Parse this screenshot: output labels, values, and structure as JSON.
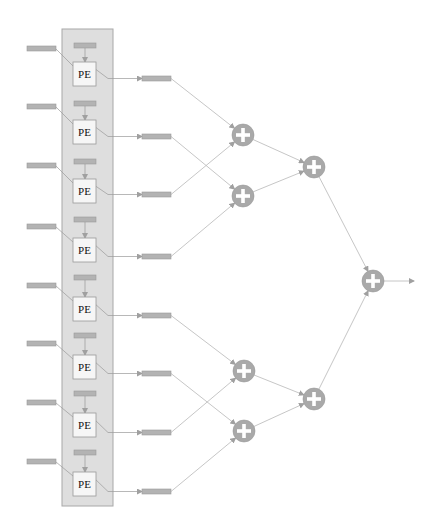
{
  "diagram": {
    "title": "",
    "pe_label": "PE",
    "colors": {
      "background": "#ffffff",
      "column_fill": "#dedede",
      "column_stroke": "#a8a8a8",
      "bar_fill": "#b3b3b3",
      "bar_stroke": "#9a9a9a",
      "pe_fill": "#f6f6f6",
      "pe_stroke": "#9a9a9a",
      "adder_fill": "#a9a9a9",
      "adder_plus": "#ffffff",
      "line": "#b8b8b8"
    },
    "column": {
      "x": 62,
      "y": 29,
      "width": 51,
      "height": 477
    },
    "rows": [
      {
        "index": 1,
        "pe_label": "PE",
        "top_bar_y": 43,
        "left_bar_y": 46,
        "pe_y": 62,
        "out_bar_y": 76
      },
      {
        "index": 2,
        "pe_label": "PE",
        "top_bar_y": 101,
        "left_bar_y": 104,
        "pe_y": 120,
        "out_bar_y": 134
      },
      {
        "index": 3,
        "pe_label": "PE",
        "top_bar_y": 159,
        "left_bar_y": 163,
        "pe_y": 179,
        "out_bar_y": 192
      },
      {
        "index": 4,
        "pe_label": "PE",
        "top_bar_y": 217,
        "left_bar_y": 224,
        "pe_y": 238,
        "out_bar_y": 254
      },
      {
        "index": 5,
        "pe_label": "PE",
        "top_bar_y": 275,
        "left_bar_y": 283,
        "pe_y": 297,
        "out_bar_y": 313
      },
      {
        "index": 6,
        "pe_label": "PE",
        "top_bar_y": 333,
        "left_bar_y": 341,
        "pe_y": 355,
        "out_bar_y": 371
      },
      {
        "index": 7,
        "pe_label": "PE",
        "top_bar_y": 391,
        "left_bar_y": 400,
        "pe_y": 413,
        "out_bar_y": 430
      },
      {
        "index": 8,
        "pe_label": "PE",
        "top_bar_y": 450,
        "left_bar_y": 459,
        "pe_y": 472,
        "out_bar_y": 489
      }
    ],
    "adders": [
      {
        "id": "a1",
        "level": 1,
        "cx": 243,
        "cy": 135,
        "inputs": [
          "row1",
          "row3"
        ]
      },
      {
        "id": "a2",
        "level": 1,
        "cx": 243,
        "cy": 196,
        "inputs": [
          "row2",
          "row4"
        ]
      },
      {
        "id": "a3",
        "level": 1,
        "cx": 244,
        "cy": 371,
        "inputs": [
          "row5",
          "row7"
        ]
      },
      {
        "id": "a4",
        "level": 1,
        "cx": 244,
        "cy": 431,
        "inputs": [
          "row6",
          "row8"
        ]
      },
      {
        "id": "b1",
        "level": 2,
        "cx": 314,
        "cy": 167,
        "inputs": [
          "a1",
          "a2"
        ]
      },
      {
        "id": "b2",
        "level": 2,
        "cx": 314,
        "cy": 399,
        "inputs": [
          "a3",
          "a4"
        ]
      },
      {
        "id": "c1",
        "level": 3,
        "cx": 373,
        "cy": 281,
        "inputs": [
          "b1",
          "b2"
        ]
      }
    ],
    "output_arrow": {
      "x1": 384,
      "y": 281,
      "x2": 414
    }
  }
}
